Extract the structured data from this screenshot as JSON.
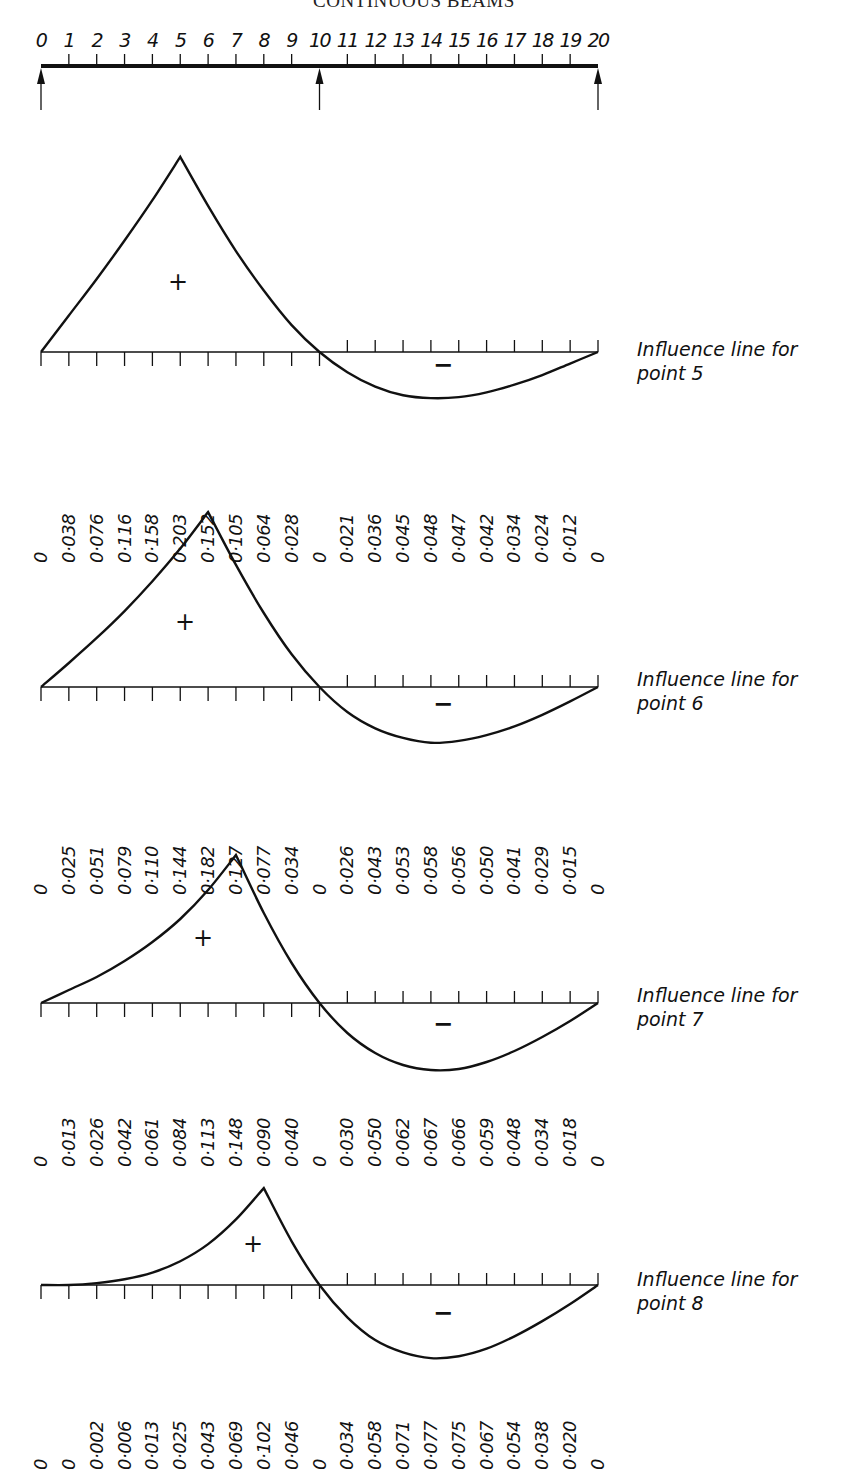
{
  "page": {
    "header": "CONTINUOUS BEAMS",
    "page_number": "1"
  },
  "beam": {
    "point_labels": [
      "0",
      "1",
      "2",
      "3",
      "4",
      "5",
      "6",
      "7",
      "8",
      "9",
      "10",
      "11",
      "12",
      "13",
      "14",
      "15",
      "16",
      "17",
      "18",
      "19",
      "20"
    ],
    "supports_at": [
      0,
      10,
      20
    ]
  },
  "diagrams": [
    {
      "label_line1": "Influence line for",
      "label_line2": "point 5",
      "plus_sign": "+",
      "minus_sign": "−",
      "values": [
        "0",
        "0·038",
        "0·076",
        "0·116",
        "0·158",
        "0·203",
        "0·152",
        "0·105",
        "0·064",
        "0·028",
        "0",
        "0·021",
        "0·036",
        "0·045",
        "0·048",
        "0·047",
        "0·042",
        "0·034",
        "0·024",
        "0·012",
        "0"
      ]
    },
    {
      "label_line1": "Influence line for",
      "label_line2": "point 6",
      "plus_sign": "+",
      "minus_sign": "−",
      "values": [
        "0",
        "0·025",
        "0·051",
        "0·079",
        "0·110",
        "0·144",
        "0·182",
        "0·127",
        "0·077",
        "0·034",
        "0",
        "0·026",
        "0·043",
        "0·053",
        "0·058",
        "0·056",
        "0·050",
        "0·041",
        "0·029",
        "0·015",
        "0"
      ]
    },
    {
      "label_line1": "Influence line for",
      "label_line2": "point 7",
      "plus_sign": "+",
      "minus_sign": "−",
      "values": [
        "0",
        "0·013",
        "0·026",
        "0·042",
        "0·061",
        "0·084",
        "0·113",
        "0·148",
        "0·090",
        "0·040",
        "0",
        "0·030",
        "0·050",
        "0·062",
        "0·067",
        "0·066",
        "0·059",
        "0·048",
        "0·034",
        "0·018",
        "0"
      ]
    },
    {
      "label_line1": "Influence line for",
      "label_line2": "point 8",
      "plus_sign": "+",
      "minus_sign": "−",
      "values": [
        "0",
        "0",
        "0·002",
        "0·006",
        "0·013",
        "0·025",
        "0·043",
        "0·069",
        "0·102",
        "0·046",
        "0",
        "0·034",
        "0·058",
        "0·071",
        "0·077",
        "0·075",
        "0·067",
        "0·054",
        "0·038",
        "0·020",
        "0"
      ]
    }
  ],
  "chart_data": [
    {
      "type": "line",
      "title": "Influence line for point 5",
      "x": [
        0,
        1,
        2,
        3,
        4,
        5,
        6,
        7,
        8,
        9,
        10,
        11,
        12,
        13,
        14,
        15,
        16,
        17,
        18,
        19,
        20
      ],
      "values": [
        0,
        0.038,
        0.076,
        0.116,
        0.158,
        0.203,
        0.152,
        0.105,
        0.064,
        0.028,
        0,
        -0.021,
        -0.036,
        -0.045,
        -0.048,
        -0.047,
        -0.042,
        -0.034,
        -0.024,
        -0.012,
        0
      ],
      "xlabel": "Point along two-span continuous beam",
      "ylabel": "Influence ordinate",
      "supports": [
        0,
        10,
        20
      ],
      "grid": false
    },
    {
      "type": "line",
      "title": "Influence line for point 6",
      "x": [
        0,
        1,
        2,
        3,
        4,
        5,
        6,
        7,
        8,
        9,
        10,
        11,
        12,
        13,
        14,
        15,
        16,
        17,
        18,
        19,
        20
      ],
      "values": [
        0,
        0.025,
        0.051,
        0.079,
        0.11,
        0.144,
        0.182,
        0.127,
        0.077,
        0.034,
        0,
        -0.026,
        -0.043,
        -0.053,
        -0.058,
        -0.056,
        -0.05,
        -0.041,
        -0.029,
        -0.015,
        0
      ],
      "xlabel": "Point along two-span continuous beam",
      "ylabel": "Influence ordinate",
      "supports": [
        0,
        10,
        20
      ],
      "grid": false
    },
    {
      "type": "line",
      "title": "Influence line for point 7",
      "x": [
        0,
        1,
        2,
        3,
        4,
        5,
        6,
        7,
        8,
        9,
        10,
        11,
        12,
        13,
        14,
        15,
        16,
        17,
        18,
        19,
        20
      ],
      "values": [
        0,
        0.013,
        0.026,
        0.042,
        0.061,
        0.084,
        0.113,
        0.148,
        0.09,
        0.04,
        0,
        -0.03,
        -0.05,
        -0.062,
        -0.067,
        -0.066,
        -0.059,
        -0.048,
        -0.034,
        -0.018,
        0
      ],
      "xlabel": "Point along two-span continuous beam",
      "ylabel": "Influence ordinate",
      "supports": [
        0,
        10,
        20
      ],
      "grid": false
    },
    {
      "type": "line",
      "title": "Influence line for point 8",
      "x": [
        0,
        1,
        2,
        3,
        4,
        5,
        6,
        7,
        8,
        9,
        10,
        11,
        12,
        13,
        14,
        15,
        16,
        17,
        18,
        19,
        20
      ],
      "values": [
        0,
        0,
        0.002,
        0.006,
        0.013,
        0.025,
        0.043,
        0.069,
        0.102,
        0.046,
        0,
        -0.034,
        -0.058,
        -0.071,
        -0.077,
        -0.075,
        -0.067,
        -0.054,
        -0.038,
        -0.02,
        0
      ],
      "xlabel": "Point along two-span continuous beam",
      "ylabel": "Influence ordinate",
      "supports": [
        0,
        10,
        20
      ],
      "grid": false
    }
  ]
}
